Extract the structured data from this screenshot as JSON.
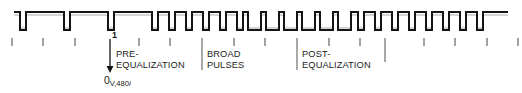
{
  "figure": {
    "type": "timing-waveform"
  },
  "colors": {
    "trace": "#141414",
    "tick": "#7a7a7a",
    "separator": "#6e6e6e",
    "text": "#1b1b1b",
    "background": "#ffffff"
  },
  "waveform": {
    "baseline_top_y": 12,
    "baseline_bottom_y": 30,
    "stroke_width": 2,
    "start_x": 14,
    "end_x": 508,
    "segments": [
      {
        "name": "line-sync",
        "pulse_count": 3,
        "pulse_width": 6,
        "period": 44,
        "first_pulse_x": 20
      },
      {
        "name": "pre-equalization",
        "pulse_count": 6,
        "pulse_width": 6,
        "period": 17,
        "first_pulse_x": 152
      },
      {
        "name": "broad-pulses",
        "pulse_count": 6,
        "low_width": 13,
        "period": 18,
        "first_low_x": 200
      },
      {
        "name": "post-equalization",
        "pulse_count": 8,
        "pulse_width": 6,
        "period": 17,
        "first_pulse_x": 308
      },
      {
        "name": "line-sync-trailing",
        "pulse_count": 3,
        "pulse_width": 6,
        "period": 44,
        "first_pulse_x": 444
      }
    ]
  },
  "ticks": {
    "y_top": 38,
    "y_bottom": 46,
    "positions": [
      12,
      43,
      75,
      107,
      139,
      170,
      202,
      234,
      265,
      297,
      329,
      360,
      392,
      424,
      455,
      487,
      518
    ]
  },
  "separators": {
    "y_top": 38,
    "y_bottom": 72,
    "positions": [
      110,
      202,
      297,
      385
    ]
  },
  "marker": {
    "label": "1",
    "x": 112,
    "y": 32,
    "arrow_x": 110,
    "arrow_top_y": 40,
    "arrow_tip_y": 72
  },
  "labels": {
    "pre_equalization": {
      "line1": "PRE-",
      "line2": "EQUALIZATION",
      "x": 115,
      "y": 50
    },
    "broad_pulses": {
      "line1": "BROAD",
      "line2": "PULSES",
      "x": 207,
      "y": 50
    },
    "post_equalization": {
      "line1": "POST-",
      "line2": "EQUALIZATION",
      "x": 302,
      "y": 50
    }
  },
  "origin": {
    "value": "0",
    "subscript_prefix": "V,480",
    "subscript_italic": "i",
    "x": 104,
    "y": 75
  }
}
